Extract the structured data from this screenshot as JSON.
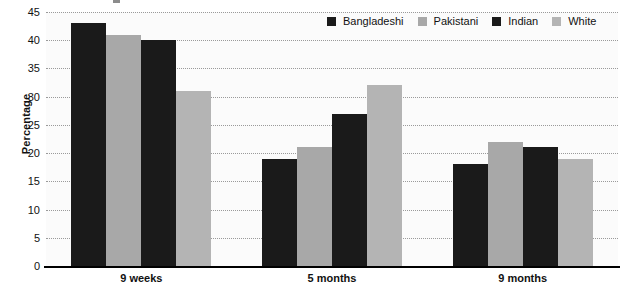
{
  "chart_data": {
    "type": "bar",
    "title": "",
    "subtitle": "",
    "xlabel": "",
    "ylabel": "Percentage",
    "categories": [
      "9 weeks",
      "5 months",
      "9 months"
    ],
    "series": [
      {
        "name": "Bangladeshi",
        "color": "#1a1a1a",
        "values": [
          43,
          19,
          18
        ]
      },
      {
        "name": "Pakistani",
        "color": "#a8a8a8",
        "values": [
          41,
          21,
          22
        ]
      },
      {
        "name": "Indian",
        "color": "#1a1a1a",
        "values": [
          40,
          27,
          21
        ]
      },
      {
        "name": "White",
        "color": "#b4b4b4",
        "values": [
          31,
          32,
          19
        ]
      }
    ],
    "ylim": [
      0,
      45
    ],
    "ytick_step": 5,
    "yticks": [
      0,
      5,
      10,
      15,
      20,
      25,
      30,
      35,
      40,
      45
    ],
    "ytick_labels": [
      "0",
      "5",
      "10",
      "15",
      "20",
      "25",
      "30",
      "35",
      "40",
      "45"
    ],
    "grid": true,
    "grid_style": "dotted",
    "grid_color": "#9a9a9a",
    "legend_position": "top-right",
    "plot_background": "#fbfbfb",
    "axis_color": "#000000"
  },
  "legend": {
    "items": [
      {
        "label": "Bangladeshi",
        "color": "#1a1a1a"
      },
      {
        "label": "Pakistani",
        "color": "#a8a8a8"
      },
      {
        "label": "Indian",
        "color": "#1a1a1a"
      },
      {
        "label": "White",
        "color": "#b4b4b4"
      }
    ]
  },
  "axes": {
    "y_title": "Percentage"
  }
}
